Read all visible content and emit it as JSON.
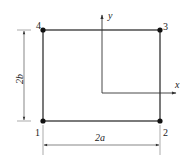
{
  "diagram": {
    "type": "rectangular element with nodes and local coordinate axes",
    "colors": {
      "line": "#333333",
      "node": "#111111",
      "background": "#ffffff"
    },
    "nodes": [
      {
        "id": "1",
        "label": "1"
      },
      {
        "id": "2",
        "label": "2"
      },
      {
        "id": "3",
        "label": "3"
      },
      {
        "id": "4",
        "label": "4"
      }
    ],
    "axes": {
      "x_label": "x",
      "y_label": "y"
    },
    "dimensions": {
      "width_label": "2a",
      "height_label": "2b"
    }
  }
}
